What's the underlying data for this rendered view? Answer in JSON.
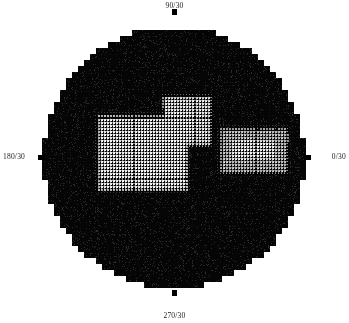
{
  "page": {
    "width": 349,
    "height": 323,
    "background_color": "#ffffff"
  },
  "plot": {
    "type": "perimetry-grayscale-disc",
    "center_x": 174,
    "center_y": 158,
    "radius": 131,
    "disc_color": "#050505",
    "grid_spacing": 3.05,
    "dot_size": 2,
    "peak_color": "#ffffff"
  },
  "labels": {
    "top": "90/30",
    "right": "0/30",
    "bottom": "270/30",
    "left": "180/30"
  },
  "ticks": {
    "top": "tick-90",
    "right": "tick-0",
    "bottom": "tick-270",
    "left": "tick-180"
  },
  "chart_data": {
    "type": "heatmap",
    "title": "",
    "xlabel": "",
    "ylabel": "",
    "meridian_labels": [
      "90/30",
      "0/30",
      "270/30",
      "180/30"
    ],
    "eccentricity_deg": 30,
    "legend_position": "none",
    "grid": true,
    "colormap": "grayscale",
    "value_range": [
      0,
      1
    ],
    "blobs": [
      {
        "name": "main-central-blob",
        "shape": "rounded-rect",
        "cx": 142,
        "cy": 152,
        "half_width": 44,
        "half_height": 36,
        "peak": 1.0,
        "edge_softness": 9
      },
      {
        "name": "upper-superior-extension",
        "shape": "rounded-rect",
        "cx": 186,
        "cy": 120,
        "half_width": 23,
        "half_height": 24,
        "peak": 0.95,
        "edge_softness": 8
      },
      {
        "name": "superior-hot-core",
        "shape": "rounded-rect",
        "cx": 183,
        "cy": 122,
        "half_width": 11,
        "half_height": 12,
        "peak": 1.0,
        "edge_softness": 5
      },
      {
        "name": "central-hot-core",
        "shape": "rounded-rect",
        "cx": 144,
        "cy": 152,
        "half_width": 31,
        "half_height": 24,
        "peak": 1.0,
        "edge_softness": 6
      },
      {
        "name": "right-temporal-blob",
        "shape": "rounded-rect",
        "cx": 253,
        "cy": 150,
        "half_width": 33,
        "half_height": 22,
        "peak": 0.78,
        "edge_softness": 9
      },
      {
        "name": "right-temporal-core",
        "shape": "rounded-rect",
        "cx": 253,
        "cy": 149,
        "half_width": 22,
        "half_height": 10,
        "peak": 1.0,
        "edge_softness": 5
      }
    ],
    "background_noise_level": 0.05
  }
}
